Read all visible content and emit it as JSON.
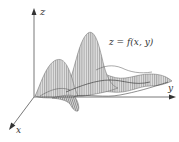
{
  "figure": {
    "axes": {
      "z_label": "z",
      "y_label": "y",
      "x_label": "x"
    },
    "surface_label": "z = f(x, y)",
    "colors": {
      "axis": "#555555",
      "mesh": "#6a6a6a",
      "mesh_fill": "#d8d8d8",
      "text": "#333333"
    }
  }
}
